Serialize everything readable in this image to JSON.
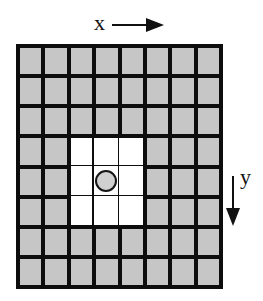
{
  "diagram": {
    "axes": {
      "x": {
        "label": "x",
        "direction": "right",
        "icon": "arrow-right-icon"
      },
      "y": {
        "label": "y",
        "direction": "down",
        "icon": "arrow-down-icon"
      }
    },
    "grid": {
      "columns": 8,
      "rows": 8,
      "cell_color": "#c6c6c6",
      "line_color": "#0d0d0d",
      "highlight_color": "#ffffff",
      "highlight_region": {
        "col_start": 2,
        "col_end": 4,
        "row_start": 3,
        "row_end": 5
      },
      "marker": {
        "shape": "circle",
        "col": 3,
        "row": 4,
        "icon": "circle-marker-icon"
      }
    }
  }
}
